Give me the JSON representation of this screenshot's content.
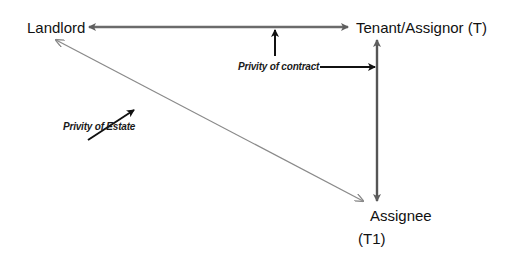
{
  "diagram": {
    "nodes": {
      "landlord": "Landlord",
      "tenant": "Tenant/Assignor (T)",
      "assignee_line1": "Assignee",
      "assignee_line2": "(T1)"
    },
    "labels": {
      "privity_contract": "Privity of contract",
      "privity_estate": "Privity of Estate"
    },
    "edges": [
      {
        "from": "Landlord",
        "to": "Tenant/Assignor (T)",
        "type": "double-arrow",
        "meaning": "Privity of contract"
      },
      {
        "from": "Tenant/Assignor (T)",
        "to": "Assignee (T1)",
        "type": "double-arrow",
        "meaning": "Privity of contract"
      },
      {
        "from": "Landlord",
        "to": "Assignee (T1)",
        "type": "double-arrow",
        "meaning": "Privity of Estate"
      }
    ],
    "colors": {
      "contract_line": "#6b6b6b",
      "estate_line": "#8a8a8a",
      "pointer": "#111111",
      "text": "#111111"
    }
  }
}
